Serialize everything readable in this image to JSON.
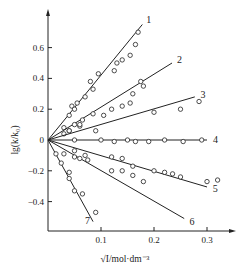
{
  "chart_data": {
    "type": "scatter",
    "title": "",
    "xlabel": "√I/mol·dm⁻³",
    "ylabel": "lg(k/k₀)",
    "xlim": [
      0,
      0.35
    ],
    "ylim": [
      -0.58,
      0.8
    ],
    "xticks": [
      {
        "value": 0.1,
        "label": "0.1"
      },
      {
        "value": 0.2,
        "label": "0.2"
      },
      {
        "value": 0.3,
        "label": "0.3"
      }
    ],
    "yticks": [
      {
        "value": 0.6,
        "label": "0.6"
      },
      {
        "value": 0.4,
        "label": "0.4"
      },
      {
        "value": 0.2,
        "label": "0.2"
      },
      {
        "value": 0,
        "label": "0"
      },
      {
        "value": -0.2,
        "label": "−0.2"
      },
      {
        "value": -0.4,
        "label": "−0.4"
      }
    ],
    "grid": false,
    "series": [
      {
        "name": "1",
        "fit_end": [
          0.178,
          0.75
        ],
        "points": [
          [
            0.03,
            0.08
          ],
          [
            0.04,
            0.16
          ],
          [
            0.045,
            0.22
          ],
          [
            0.05,
            0.2
          ],
          [
            0.055,
            0.24
          ],
          [
            0.07,
            0.28
          ],
          [
            0.08,
            0.38
          ],
          [
            0.085,
            0.33
          ],
          [
            0.095,
            0.43
          ],
          [
            0.125,
            0.45
          ],
          [
            0.13,
            0.5
          ],
          [
            0.14,
            0.52
          ],
          [
            0.155,
            0.55
          ],
          [
            0.165,
            0.62
          ],
          [
            0.17,
            0.7
          ]
        ]
      },
      {
        "name": "2",
        "fit_end": [
          0.234,
          0.5
        ],
        "points": [
          [
            0.03,
            0.04
          ],
          [
            0.04,
            0.06
          ],
          [
            0.05,
            0.1
          ],
          [
            0.06,
            0.09
          ],
          [
            0.065,
            0.13
          ],
          [
            0.085,
            0.17
          ],
          [
            0.105,
            0.16
          ],
          [
            0.12,
            0.2
          ],
          [
            0.14,
            0.22
          ],
          [
            0.155,
            0.24
          ],
          [
            0.16,
            0.3
          ],
          [
            0.175,
            0.38
          ],
          [
            0.18,
            0.35
          ]
        ]
      },
      {
        "name": "3",
        "fit_end": [
          0.277,
          0.28
        ],
        "points": [
          [
            0.04,
            0.06
          ],
          [
            0.06,
            0.1
          ],
          [
            0.09,
            0.06
          ],
          [
            0.2,
            0.18
          ],
          [
            0.25,
            0.2
          ],
          [
            0.285,
            0.25
          ]
        ]
      },
      {
        "name": "4",
        "fit_end": [
          0.3,
          0.0
        ],
        "points": [
          [
            0.05,
            0.0
          ],
          [
            0.1,
            0.0
          ],
          [
            0.125,
            -0.01
          ],
          [
            0.15,
            0.0
          ],
          [
            0.165,
            -0.01
          ],
          [
            0.19,
            -0.01
          ],
          [
            0.22,
            0.0
          ],
          [
            0.255,
            -0.01
          ],
          [
            0.29,
            0.0
          ]
        ]
      },
      {
        "name": "5",
        "fit_end": [
          0.3,
          -0.305
        ],
        "points": [
          [
            0.05,
            -0.07
          ],
          [
            0.07,
            -0.1
          ],
          [
            0.12,
            -0.11
          ],
          [
            0.14,
            -0.12
          ],
          [
            0.16,
            -0.17
          ],
          [
            0.2,
            -0.2
          ],
          [
            0.22,
            -0.21
          ],
          [
            0.235,
            -0.22
          ],
          [
            0.25,
            -0.24
          ],
          [
            0.3,
            -0.27
          ],
          [
            0.32,
            -0.26
          ]
        ]
      },
      {
        "name": "6",
        "fit_end": [
          0.257,
          -0.51
        ],
        "points": [
          [
            0.03,
            -0.09
          ],
          [
            0.05,
            -0.11
          ],
          [
            0.06,
            -0.12
          ],
          [
            0.075,
            -0.13
          ],
          [
            0.12,
            -0.2
          ],
          [
            0.14,
            -0.2
          ],
          [
            0.16,
            -0.23
          ],
          [
            0.18,
            -0.27
          ]
        ]
      },
      {
        "name": "7",
        "fit_end": [
          0.085,
          -0.53
        ],
        "points": [
          [
            0.015,
            -0.09
          ],
          [
            0.025,
            -0.15
          ],
          [
            0.04,
            -0.21
          ],
          [
            0.04,
            -0.25
          ],
          [
            0.05,
            -0.33
          ],
          [
            0.065,
            -0.35
          ],
          [
            0.09,
            -0.47
          ]
        ]
      }
    ]
  }
}
